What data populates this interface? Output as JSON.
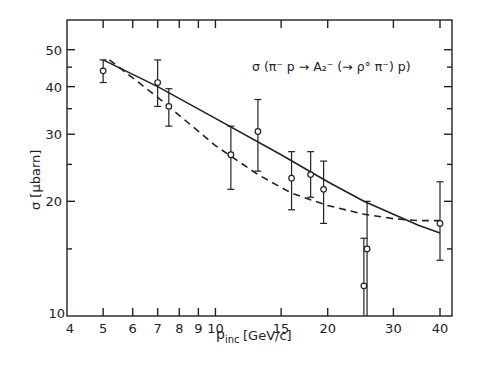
{
  "chart_data": {
    "type": "scatter",
    "annotation": "σ (π⁻ p → A₂⁻ (→ ρ° π⁻) p)",
    "xlabel": "p_inc [GeV/c]",
    "xlabel_main": "p",
    "xlabel_sub": "inc",
    "xlabel_unit": "[GeV/c]",
    "ylabel": "σ [μbarn]",
    "xscale": "log",
    "yscale": "log",
    "xlim": [
      4,
      44
    ],
    "ylim": [
      10,
      58
    ],
    "grid": false,
    "legend": "none",
    "x_ticks": [
      4,
      5,
      6,
      7,
      8,
      9,
      10,
      15,
      20,
      30,
      40
    ],
    "x_tick_labels": [
      "4",
      "5",
      "6",
      "7",
      "8",
      "9",
      "10",
      "15",
      "20",
      "30",
      "40"
    ],
    "y_ticks_major": [
      10,
      20,
      30,
      40,
      50
    ],
    "y_tick_labels": [
      "10",
      "20",
      "30",
      "40",
      "50"
    ],
    "y_ticks_minor": [
      15,
      25,
      35,
      45
    ],
    "series": [
      {
        "name": "data",
        "style": "open circles with error bars",
        "points": [
          {
            "x": 5,
            "y": 44,
            "ylo": 41,
            "yhi": 47
          },
          {
            "x": 7,
            "y": 41,
            "ylo": 35.5,
            "yhi": 47
          },
          {
            "x": 7.5,
            "y": 35.5,
            "ylo": 31.5,
            "yhi": 39.5
          },
          {
            "x": 11,
            "y": 26.5,
            "ylo": 21.5,
            "yhi": 31.5
          },
          {
            "x": 13,
            "y": 30.5,
            "ylo": 24,
            "yhi": 37
          },
          {
            "x": 16,
            "y": 23,
            "ylo": 19,
            "yhi": 27
          },
          {
            "x": 18,
            "y": 23.5,
            "ylo": 20.5,
            "yhi": 27
          },
          {
            "x": 19.5,
            "y": 21.5,
            "ylo": 17.5,
            "yhi": 25.5
          },
          {
            "x": 25,
            "y": 12,
            "ylo": 10,
            "yhi": 16
          },
          {
            "x": 25.5,
            "y": 15,
            "ylo": 10,
            "yhi": 20
          },
          {
            "x": 40,
            "y": 17.5,
            "ylo": 14,
            "yhi": 22.5
          }
        ]
      },
      {
        "name": "fit-solid",
        "style": "solid line",
        "x": [
          5,
          7,
          10,
          15,
          20,
          25,
          30,
          35,
          40
        ],
        "values": [
          47,
          40,
          33,
          26.5,
          22.5,
          20,
          18.5,
          17.3,
          16.5
        ]
      },
      {
        "name": "fit-dashed",
        "style": "dashed line",
        "x": [
          5.2,
          7,
          10,
          13,
          16,
          20,
          25,
          30,
          35,
          40
        ],
        "values": [
          47,
          37.5,
          28,
          23.5,
          21,
          19.5,
          18.5,
          18,
          17.8,
          17.8
        ]
      }
    ]
  }
}
